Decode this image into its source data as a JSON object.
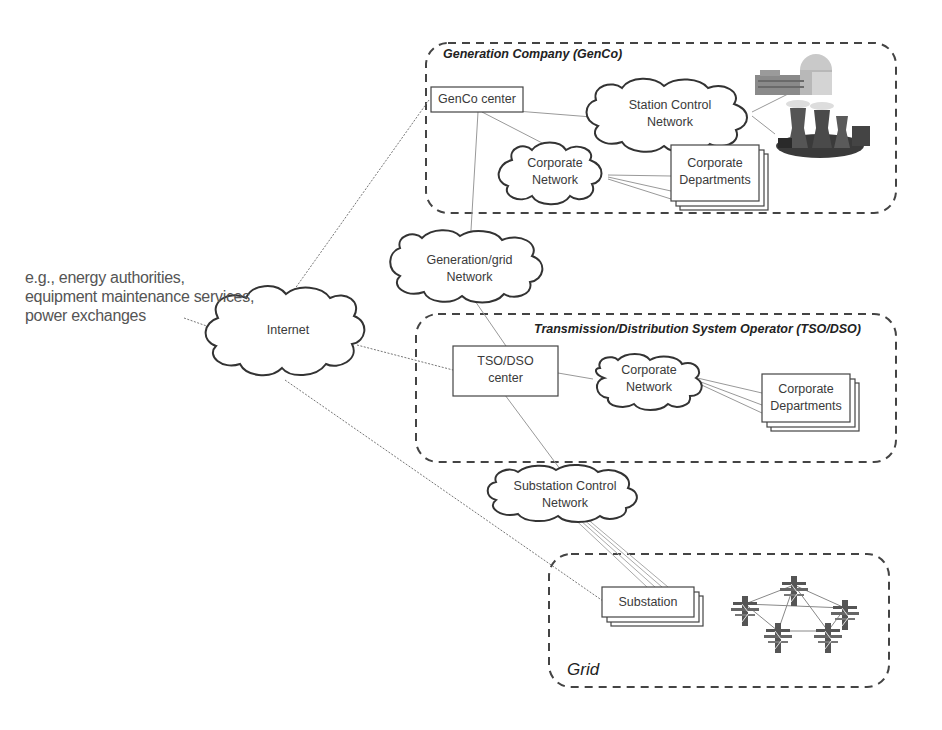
{
  "diagram": {
    "external_note": {
      "lines": [
        "e.g., energy authorities,",
        "equipment maintenance services,",
        "power exchanges"
      ]
    },
    "domains": {
      "genco": {
        "title": "Generation Company (GenCo)"
      },
      "tso": {
        "title": "Transmission/Distribution System Operator (TSO/DSO)"
      },
      "grid": {
        "title": "Grid"
      }
    },
    "nodes": {
      "internet": {
        "label": "Internet",
        "type": "cloud"
      },
      "genco_center": {
        "label": "GenCo center",
        "type": "box"
      },
      "station_control": {
        "line1": "Station Control",
        "line2": "Network",
        "type": "cloud"
      },
      "genco_corporate_net": {
        "line1": "Corporate",
        "line2": "Network",
        "type": "cloud"
      },
      "genco_corporate_depts": {
        "line1": "Corporate",
        "line2": "Departments",
        "type": "stacked-box"
      },
      "gen_grid_net": {
        "line1": "Generation/grid",
        "line2": "Network",
        "type": "cloud"
      },
      "tso_center": {
        "line1": "TSO/DSO",
        "line2": "center",
        "type": "box"
      },
      "tso_corporate_net": {
        "line1": "Corporate",
        "line2": "Network",
        "type": "cloud"
      },
      "tso_corporate_depts": {
        "line1": "Corporate",
        "line2": "Departments",
        "type": "stacked-box"
      },
      "substation_control": {
        "line1": "Substation Control",
        "line2": "Network",
        "type": "cloud"
      },
      "substation": {
        "label": "Substation",
        "type": "stacked-box"
      }
    },
    "icons": [
      "nuclear-plant-icon",
      "cooling-tower-plant-icon",
      "transmission-pylon-icon"
    ],
    "colors": {
      "line": "#8a8a8a",
      "border": "#333333",
      "dashed": "#444444",
      "text": "#3a3a3a"
    }
  }
}
